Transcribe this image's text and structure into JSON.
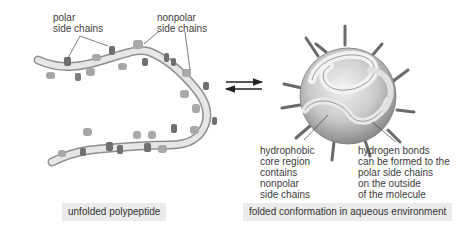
{
  "diagram": {
    "left_panel": {
      "labels": {
        "polar": "polar\nside chains",
        "nonpolar": "nonpolar\nside chains"
      },
      "caption": "unfolded polypeptide"
    },
    "equilibrium_arrows": {
      "forward": "arrow-right",
      "reverse": "arrow-left"
    },
    "right_panel": {
      "labels": {
        "core": "hydrophobic\ncore region\ncontains\nnonpolar\nside chains",
        "hbonds": "hydrogen bonds\ncan be formed to the\npolar side chains\non the outside\nof the molecule"
      },
      "caption": "folded conformation in aqueous environment"
    },
    "colors": {
      "backbone": "#d8d8d8",
      "backbone_shadow": "#9a9a9a",
      "side_chain_polar": "#6f6f6f",
      "side_chain_nonpolar": "#a8a8a8",
      "caption_bg": "#ebebeb",
      "text": "#3a3a3a"
    }
  }
}
